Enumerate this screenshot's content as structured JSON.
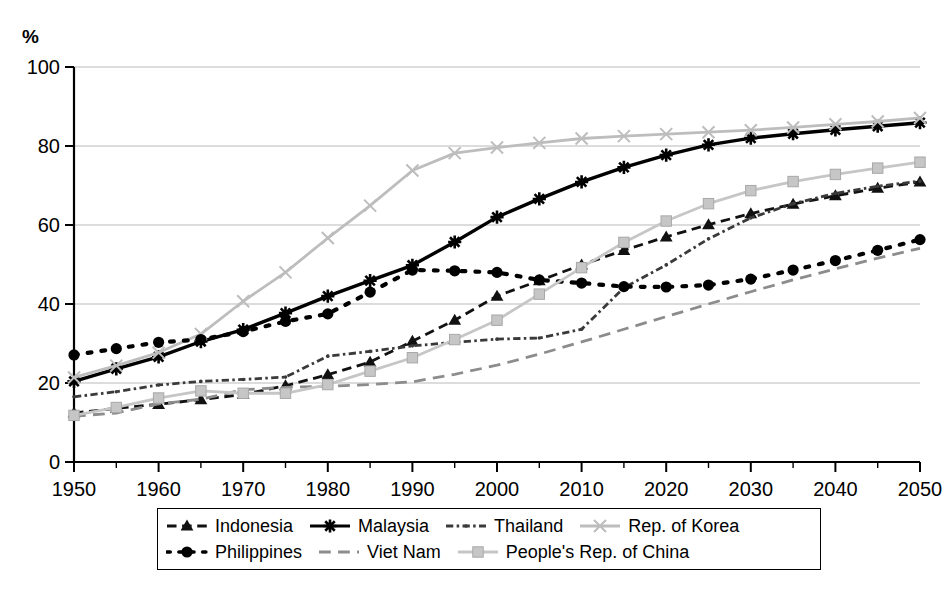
{
  "axis_title": "%",
  "chart_data": {
    "type": "line",
    "title": "",
    "xlabel": "",
    "ylabel": "%",
    "xlim": [
      1950,
      2050
    ],
    "ylim": [
      0,
      100
    ],
    "grid": true,
    "legend_position": "bottom",
    "x": [
      1950,
      1955,
      1960,
      1965,
      1970,
      1975,
      1980,
      1985,
      1990,
      1995,
      2000,
      2005,
      2010,
      2015,
      2020,
      2025,
      2030,
      2035,
      2040,
      2045,
      2050
    ],
    "xticks": [
      "1950",
      "1960",
      "1970",
      "1980",
      "1990",
      "2000",
      "2010",
      "2020",
      "2030",
      "2040",
      "2050"
    ],
    "yticks": [
      "0",
      "20",
      "40",
      "60",
      "80",
      "100"
    ],
    "minor_xtick_step": 5,
    "series": [
      {
        "name": "Indonesia",
        "marker": "triangle",
        "color": "#111111",
        "style": "dashed",
        "values": [
          12.4,
          13.6,
          14.6,
          15.8,
          17.1,
          19.3,
          22.1,
          25.3,
          30.6,
          35.9,
          42.0,
          45.9,
          49.9,
          53.6,
          57.0,
          60.1,
          62.9,
          65.3,
          67.4,
          69.3,
          70.9
        ]
      },
      {
        "name": "Malaysia",
        "marker": "asterisk",
        "color": "#000000",
        "style": "solid",
        "values": [
          20.4,
          23.6,
          26.6,
          30.5,
          33.5,
          37.7,
          42.0,
          45.9,
          49.8,
          55.7,
          62.0,
          66.6,
          70.9,
          74.6,
          77.7,
          80.3,
          82.0,
          83.1,
          84.1,
          85.0,
          85.9
        ]
      },
      {
        "name": "Thailand",
        "marker": "dot-small",
        "color": "#3a3a3a",
        "style": "dash-dot",
        "values": [
          16.5,
          17.8,
          19.5,
          20.4,
          20.9,
          21.5,
          26.8,
          28.0,
          29.4,
          30.3,
          31.1,
          31.4,
          33.6,
          44.1,
          49.9,
          56.5,
          61.8,
          65.4,
          68.0,
          69.8,
          71.1
        ]
      },
      {
        "name": "Rep. of Korea",
        "marker": "x",
        "color": "#bdbdbd",
        "style": "solid",
        "values": [
          21.4,
          24.4,
          27.7,
          32.4,
          40.7,
          48.0,
          56.7,
          64.9,
          73.8,
          78.2,
          79.6,
          80.8,
          81.9,
          82.5,
          83.0,
          83.5,
          84.0,
          84.7,
          85.5,
          86.2,
          87.1
        ]
      },
      {
        "name": "Philippines",
        "marker": "circle",
        "color": "#000000",
        "style": "dotted",
        "values": [
          27.1,
          28.7,
          30.3,
          31.0,
          33.0,
          35.6,
          37.5,
          43.0,
          48.6,
          48.4,
          48.0,
          46.1,
          45.3,
          44.4,
          44.3,
          44.8,
          46.3,
          48.6,
          51.0,
          53.6,
          56.3
        ]
      },
      {
        "name": "Viet Nam",
        "marker": "none",
        "color": "#8c8c8c",
        "style": "long-dash",
        "values": [
          11.6,
          12.4,
          14.7,
          15.9,
          18.3,
          18.9,
          19.2,
          19.6,
          20.3,
          22.2,
          24.5,
          27.3,
          30.4,
          33.6,
          36.8,
          40.0,
          43.1,
          46.1,
          48.9,
          51.6,
          54.1
        ]
      },
      {
        "name": "People's Rep. of China",
        "marker": "square",
        "color": "#c6c6c6",
        "style": "solid",
        "values": [
          11.8,
          13.8,
          16.2,
          18.0,
          17.4,
          17.4,
          19.6,
          23.0,
          26.4,
          31.0,
          35.9,
          42.5,
          49.2,
          55.6,
          61.0,
          65.4,
          68.7,
          71.0,
          72.8,
          74.4,
          75.9
        ]
      }
    ]
  },
  "legend": {
    "rows": [
      [
        {
          "label": "Indonesia",
          "series": 0
        },
        {
          "label": "Malaysia",
          "series": 1
        },
        {
          "label": "Thailand",
          "series": 2
        },
        {
          "label": "Rep. of Korea",
          "series": 3
        }
      ],
      [
        {
          "label": "Philippines",
          "series": 4
        },
        {
          "label": "Viet Nam",
          "series": 5
        },
        {
          "label": "People's Rep. of China",
          "series": 6
        }
      ]
    ]
  }
}
